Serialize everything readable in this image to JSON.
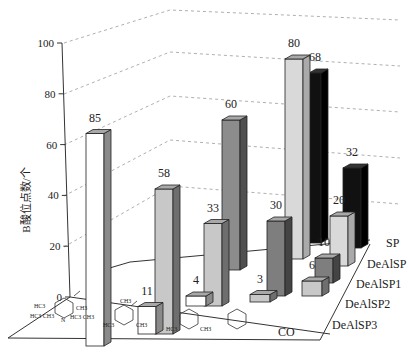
{
  "chart_data": {
    "type": "bar",
    "subtype": "3d-bar",
    "title": "",
    "ylabel": "B酸位点数/个",
    "ylim": [
      0,
      100
    ],
    "yticks": [
      "0",
      "20",
      "40",
      "60",
      "80",
      "100"
    ],
    "grid": "dashed",
    "categories": [
      "2,6-di-tert-butylpyridine",
      "2,4,6-collidine",
      "2,6-lutidine",
      "pyridine",
      "CO"
    ],
    "category_labels": [
      "DTBPy",
      "collidine",
      "lutidine",
      "pyridine",
      "CO"
    ],
    "depth_labels": [
      "SP",
      "DeAlSP",
      "DeAlSP1",
      "DeAlSP2",
      "DeAlSP3"
    ],
    "bars": [
      {
        "label": "85",
        "value": 85,
        "x": 86,
        "base": 346,
        "w": 18,
        "fill": "#ffffff",
        "side": "#8a8a8a"
      },
      {
        "label": "58",
        "value": 58,
        "x": 155,
        "base": 334,
        "w": 18,
        "fill": "#c8c8c8",
        "side": "#6e6e6e"
      },
      {
        "label": "11",
        "value": 11,
        "x": 138,
        "base": 334,
        "w": 18,
        "fill": "#ffffff",
        "side": "#8a8a8a"
      },
      {
        "label": "60",
        "value": 60,
        "x": 222,
        "base": 270,
        "w": 18,
        "fill": "#8c8c8c",
        "side": "#4f4f4f"
      },
      {
        "label": "33",
        "value": 33,
        "x": 204,
        "base": 306,
        "w": 18,
        "fill": "#c8c8c8",
        "side": "#6e6e6e"
      },
      {
        "label": "4",
        "value": 4,
        "x": 186,
        "base": 306,
        "w": 20,
        "fill": "#ffffff",
        "side": "#8a8a8a"
      },
      {
        "label": "80",
        "value": 80,
        "x": 285,
        "base": 259,
        "w": 18,
        "fill": "#d9d9d9",
        "side": "#aaaaaa"
      },
      {
        "label": "68",
        "value": 68,
        "x": 309,
        "base": 243,
        "w": 12,
        "fill": "#111111",
        "side": "#000000"
      },
      {
        "label": "30",
        "value": 30,
        "x": 267,
        "base": 296,
        "w": 18,
        "fill": "#7e7e7e",
        "side": "#444444"
      },
      {
        "label": "3",
        "value": 3,
        "x": 250,
        "base": 302,
        "w": 20,
        "fill": "#c8c8c8",
        "side": "#6e6e6e"
      },
      {
        "label": "32",
        "value": 32,
        "x": 343,
        "base": 248,
        "w": 18,
        "fill": "#111111",
        "side": "#000000"
      },
      {
        "label": "20",
        "value": 20,
        "x": 330,
        "base": 266,
        "w": 18,
        "fill": "#d9d9d9",
        "side": "#aaaaaa"
      },
      {
        "label": "10",
        "value": 10,
        "x": 315,
        "base": 283,
        "w": 18,
        "fill": "#7e7e7e",
        "side": "#444444"
      },
      {
        "label": "6",
        "value": 6,
        "x": 302,
        "base": 296,
        "w": 20,
        "fill": "#c8c8c8",
        "side": "#6e6e6e"
      }
    ],
    "xlabel_co": "CO"
  }
}
